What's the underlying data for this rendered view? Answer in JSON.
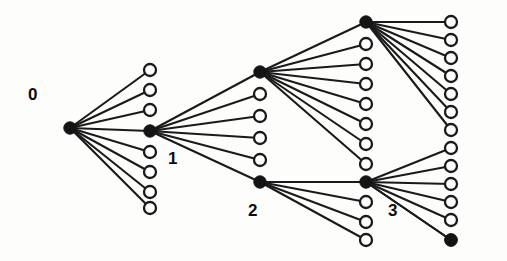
{
  "figure": {
    "kind": "node-link-diagram",
    "background_color": "#fdfdfb",
    "ink_color": "#141414",
    "edge_color": "#1a1a1a",
    "edge_width": 2.1,
    "filled_node_fill": "#141414",
    "open_node_fill": "#ffffff",
    "open_node_stroke": "#1a1a1a",
    "open_node_stroke_width": 2.3,
    "filled_node_radius": 6.2,
    "open_node_radius": 6.0,
    "width": 507,
    "height": 261
  },
  "labels": [
    {
      "id": "label-0",
      "text": "0",
      "x": 28,
      "y": 86
    },
    {
      "id": "label-1",
      "text": "1",
      "x": 168,
      "y": 150
    },
    {
      "id": "label-2",
      "text": "2",
      "x": 248,
      "y": 202
    },
    {
      "id": "label-3",
      "text": "3",
      "x": 388,
      "y": 202
    }
  ],
  "hub_nodes": [
    {
      "id": "node-0",
      "label": "0",
      "x": 70,
      "y": 128,
      "type": "filled"
    },
    {
      "id": "node-1",
      "label": "1",
      "x": 150,
      "y": 131,
      "type": "filled"
    },
    {
      "id": "node-a",
      "label": "",
      "x": 260,
      "y": 72,
      "type": "filled"
    },
    {
      "id": "node-2",
      "label": "2",
      "x": 260,
      "y": 182,
      "type": "filled"
    },
    {
      "id": "node-b",
      "label": "",
      "x": 366,
      "y": 22,
      "type": "filled"
    },
    {
      "id": "node-3",
      "label": "3",
      "x": 366,
      "y": 182,
      "type": "filled"
    },
    {
      "id": "node-c",
      "label": "",
      "x": 451,
      "y": 240,
      "type": "filled"
    }
  ],
  "leaf_columns": [
    {
      "id": "column-1",
      "x": 150,
      "parent": "node-0",
      "leaves": [
        {
          "y": 70
        },
        {
          "y": 90
        },
        {
          "y": 110
        },
        {
          "y": 152
        },
        {
          "y": 172
        },
        {
          "y": 192
        },
        {
          "y": 208
        }
      ]
    },
    {
      "id": "column-2",
      "x": 260,
      "parent": "node-1",
      "leaves": [
        {
          "y": 94
        },
        {
          "y": 116
        },
        {
          "y": 138
        },
        {
          "y": 160
        }
      ]
    },
    {
      "id": "column-3",
      "x": 366,
      "parent_upper": "node-a",
      "parent_lower": "node-2",
      "leaves_upper": [
        {
          "y": 44
        },
        {
          "y": 64
        },
        {
          "y": 84
        },
        {
          "y": 104
        },
        {
          "y": 124
        },
        {
          "y": 144
        },
        {
          "y": 164
        }
      ],
      "leaves_lower": [
        {
          "y": 202
        },
        {
          "y": 222
        },
        {
          "y": 240
        }
      ]
    },
    {
      "id": "column-4",
      "x": 451,
      "parent_upper": "node-b",
      "parent_lower": "node-3",
      "leaves_upper": [
        {
          "y": 22
        },
        {
          "y": 40
        },
        {
          "y": 58
        },
        {
          "y": 76
        },
        {
          "y": 94
        },
        {
          "y": 112
        },
        {
          "y": 130
        }
      ],
      "leaves_lower": [
        {
          "y": 148
        },
        {
          "y": 166
        },
        {
          "y": 184
        },
        {
          "y": 202
        },
        {
          "y": 220
        }
      ],
      "terminal_filled": {
        "y": 240
      }
    }
  ],
  "edges": [
    {
      "from": "node-0",
      "to_column": "column-1"
    },
    {
      "from": "node-0",
      "to": "node-1"
    },
    {
      "from": "node-1",
      "to_column": "column-2"
    },
    {
      "from": "node-1",
      "to": "node-a"
    },
    {
      "from": "node-1",
      "to": "node-2"
    },
    {
      "from": "node-a",
      "to_column": "column-3-upper"
    },
    {
      "from": "node-a",
      "to": "node-b"
    },
    {
      "from": "node-2",
      "to_column": "column-3-lower"
    },
    {
      "from": "node-2",
      "to": "node-3"
    },
    {
      "from": "node-b",
      "to_column": "column-4-upper"
    },
    {
      "from": "node-3",
      "to_column": "column-4-lower"
    },
    {
      "from": "node-3",
      "to": "node-c"
    }
  ]
}
